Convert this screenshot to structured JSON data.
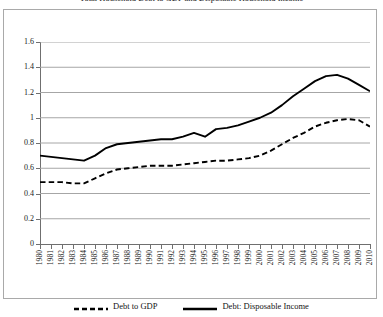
{
  "chart_data": {
    "type": "line",
    "title": "Total Household Debt to GDP and Disposable Household Income",
    "xlabel": "",
    "ylabel": "",
    "ylim": [
      0,
      1.6
    ],
    "y_ticks": [
      "0",
      "0.2",
      "0.4",
      "0.6",
      "0.8",
      "1",
      "1.2",
      "1.4",
      "1.6"
    ],
    "grid": "horizontal",
    "legend_position": "bottom",
    "categories": [
      "1980",
      "1981",
      "1982",
      "1983",
      "1984",
      "1985",
      "1986",
      "1987",
      "1988",
      "1989",
      "1990",
      "1991",
      "1992",
      "1993",
      "1994",
      "1995",
      "1996",
      "1997",
      "1998",
      "1999",
      "2000",
      "2001",
      "2002",
      "2003",
      "2004",
      "2005",
      "2006",
      "2007",
      "2008",
      "2009",
      "2010"
    ],
    "series": [
      {
        "name": "Debt to GDP",
        "style": "dashed",
        "color": "#000000",
        "values": [
          0.49,
          0.49,
          0.49,
          0.48,
          0.48,
          0.52,
          0.56,
          0.59,
          0.6,
          0.61,
          0.62,
          0.62,
          0.62,
          0.63,
          0.64,
          0.65,
          0.66,
          0.66,
          0.67,
          0.68,
          0.7,
          0.74,
          0.79,
          0.84,
          0.88,
          0.93,
          0.96,
          0.98,
          0.99,
          0.98,
          0.93
        ]
      },
      {
        "name": "Debt: Disposable Income",
        "style": "solid",
        "color": "#000000",
        "values": [
          0.7,
          0.69,
          0.68,
          0.67,
          0.66,
          0.7,
          0.76,
          0.79,
          0.8,
          0.81,
          0.82,
          0.83,
          0.83,
          0.85,
          0.88,
          0.85,
          0.91,
          0.92,
          0.94,
          0.97,
          1.0,
          1.04,
          1.1,
          1.17,
          1.23,
          1.29,
          1.33,
          1.34,
          1.31,
          1.26,
          1.21
        ]
      }
    ]
  },
  "legend": {
    "items": [
      {
        "label": "Debt to GDP",
        "style": "dashed"
      },
      {
        "label": "Debt: Disposable Income",
        "style": "solid"
      }
    ]
  }
}
